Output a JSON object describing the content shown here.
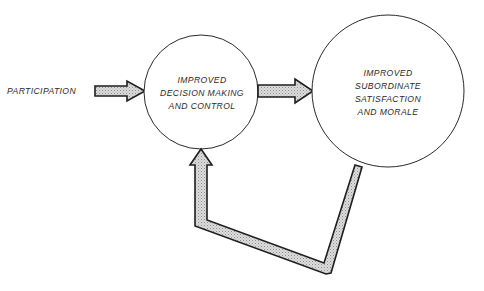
{
  "diagram": {
    "input": {
      "label": "PARTICIPATION"
    },
    "nodes": [
      {
        "id": "decision",
        "lines": [
          "IMPROVED",
          "DECISION MAKING",
          "AND CONTROL"
        ]
      },
      {
        "id": "satisfaction",
        "lines": [
          "IMPROVED",
          "SUBORDINATE",
          "SATISFACTION",
          "AND MORALE"
        ]
      }
    ],
    "edges": [
      {
        "from": "PARTICIPATION",
        "to": "decision",
        "type": "arrow"
      },
      {
        "from": "decision",
        "to": "satisfaction",
        "type": "arrow"
      },
      {
        "from": "satisfaction",
        "to": "decision",
        "type": "feedback-arrow"
      }
    ],
    "colors": {
      "stroke": "#1e1e1e",
      "arrow_fill": "#c9c9c9",
      "background": "#ffffff"
    }
  }
}
